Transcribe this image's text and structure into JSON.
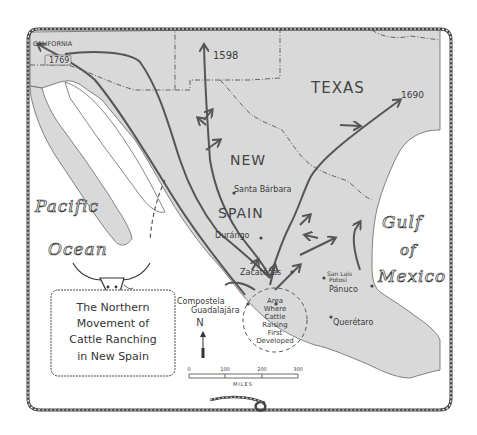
{
  "map": {
    "title_lines": [
      "The Northern",
      "Movement of",
      "Cattle Ranching",
      "in New Spain"
    ],
    "colors": {
      "land": "#d9d9d9",
      "water": "#ffffff",
      "route": "#555555",
      "border": "#444444",
      "text": "#3a3a3a"
    },
    "regions": {
      "california": "CALIFORNIA",
      "texas": "TEXAS",
      "new_spain_line1": "NEW",
      "new_spain_line2": "SPAIN"
    },
    "water_bodies": {
      "pacific_line1": "Pacific",
      "pacific_line2": "Ocean",
      "gulf_line1": "Gulf",
      "gulf_line2": "of",
      "gulf_line3": "Mexico"
    },
    "dates": {
      "california": "1769",
      "north": "1598",
      "texas": "1690"
    },
    "cities": [
      {
        "name": "Santa Bárbara"
      },
      {
        "name": "Durángo"
      },
      {
        "name": "Zacatécas"
      },
      {
        "name": "San Luis"
      },
      {
        "name": "Potosí"
      },
      {
        "name": "Pánuco"
      },
      {
        "name": "Compostela"
      },
      {
        "name": "Guadalajára"
      },
      {
        "name": "Querétaro"
      }
    ],
    "origin_area": {
      "lines": [
        "Area",
        "Where",
        "Cattle",
        "Raising",
        "First",
        "Developed"
      ]
    },
    "compass": {
      "label": "N"
    },
    "scale_bar": {
      "ticks": [
        "0",
        "100",
        "200",
        "300"
      ],
      "unit": "MILES"
    }
  }
}
